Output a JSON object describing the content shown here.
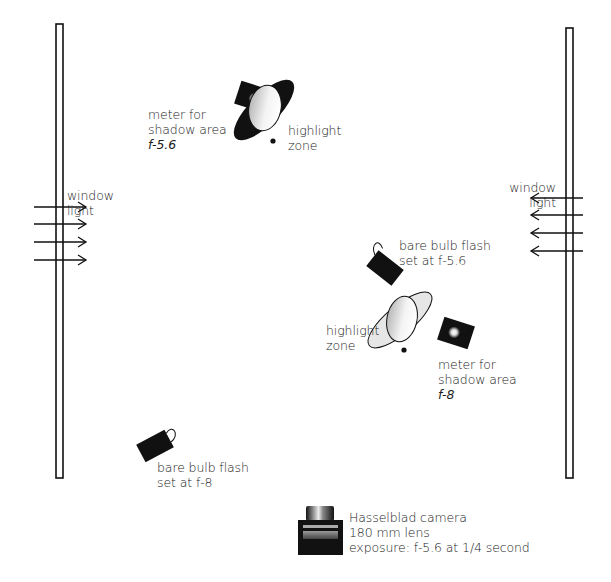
{
  "diagram": {
    "type": "lighting-setup",
    "colors": {
      "ink": "#111111",
      "reflector_fill": "#e6e6e6",
      "background": "#ffffff"
    }
  },
  "windows": {
    "left": {
      "label": [
        "window",
        "light"
      ],
      "arrow_direction": "right",
      "arrow_count": 4
    },
    "right": {
      "label": [
        "window",
        "light"
      ],
      "arrow_direction": "left",
      "arrow_count": 4
    }
  },
  "top_setup": {
    "meter_label": [
      "meter for",
      "shadow area",
      "f-5.6"
    ],
    "highlight_label": [
      "highlight",
      "zone"
    ]
  },
  "right_setup": {
    "flash_label": [
      "bare bulb flash",
      "set at f-5.6"
    ],
    "highlight_label": [
      "highlight",
      "zone"
    ],
    "meter_label": [
      "meter for",
      "shadow area",
      "f-8"
    ]
  },
  "bottom_flash": {
    "flash_label": [
      "bare bulb flash",
      "set at f-8"
    ]
  },
  "camera": {
    "label": [
      "Hasselblad camera",
      "180 mm lens",
      "exposure: f-5.6 at 1/4 second"
    ]
  }
}
